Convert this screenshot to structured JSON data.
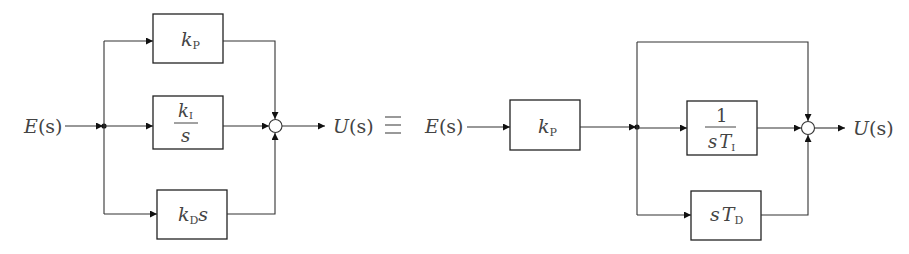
{
  "diagram": {
    "left": {
      "input": {
        "var": "E",
        "arg": "(s)"
      },
      "output": {
        "var": "U",
        "arg": "(s)"
      },
      "blocks": [
        {
          "id": "kp",
          "main": "k",
          "sub": "P"
        },
        {
          "id": "ki",
          "num_main": "k",
          "num_sub": "I",
          "den": "s"
        },
        {
          "id": "kd",
          "main": "k",
          "sub": "D",
          "suffix": "s"
        }
      ]
    },
    "equivalence_symbol": "≡",
    "right": {
      "input": {
        "var": "E",
        "arg": "(s)"
      },
      "output": {
        "var": "U",
        "arg": "(s)"
      },
      "blocks": [
        {
          "id": "kp",
          "main": "k",
          "sub": "P"
        },
        {
          "id": "ti",
          "num": "1",
          "den_pre": "s",
          "den_main": "T",
          "den_sub": "I"
        },
        {
          "id": "td",
          "pre": "s",
          "main": "T",
          "sub": "D"
        }
      ],
      "feedthrough": "direct path (gain 1)"
    },
    "colors": {
      "line": "#333333",
      "text": "#444444",
      "background": "#ffffff"
    }
  }
}
